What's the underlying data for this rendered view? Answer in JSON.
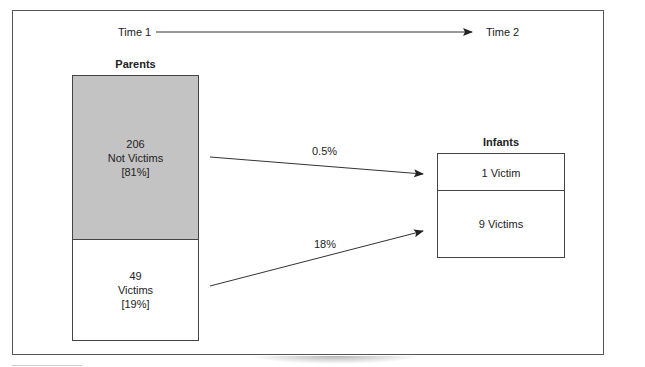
{
  "diagram": {
    "timeline": {
      "start_label": "Time 1",
      "end_label": "Time 2"
    },
    "parents": {
      "title": "Parents",
      "segments": [
        {
          "count": "206",
          "label": "Not Victims",
          "percent": "[81%]",
          "fill": "#c3c3c3"
        },
        {
          "count": "49",
          "label": "Victims",
          "percent": "[19%]",
          "fill": "#ffffff"
        }
      ]
    },
    "infants": {
      "title": "Infants",
      "segments": [
        {
          "label": "1 Victim"
        },
        {
          "label": "9 Victims"
        }
      ]
    },
    "flows": [
      {
        "from": "Not Victims",
        "to": "1 Victim",
        "label": "0.5%"
      },
      {
        "from": "Victims",
        "to": "9 Victims",
        "label": "18%"
      }
    ],
    "colors": {
      "line": "#333333",
      "shaded": "#c3c3c3",
      "border": "#444444"
    }
  }
}
